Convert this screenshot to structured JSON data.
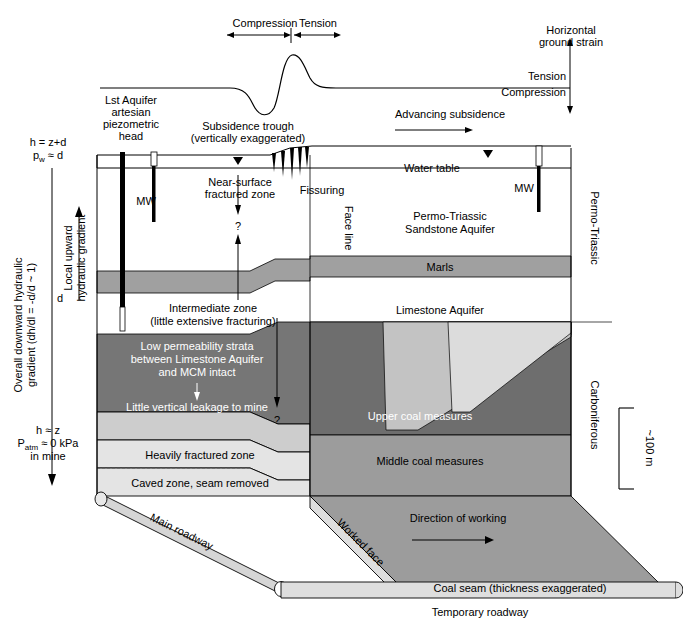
{
  "figure": {
    "type": "geological-cross-section",
    "caption_partial": "Figure 13.3  Hydrogeological conditions in the Permo-Triassic/Carboniferous..."
  },
  "strain_curve": {
    "compression_label": "Compression",
    "tension_label": "Tension",
    "axis_title_line1": "Horizontal",
    "axis_title_line2": "ground strain",
    "axis_tension": "Tension",
    "axis_compression": "Compression",
    "advancing_subsidence": "Advancing subsidence"
  },
  "surface": {
    "lst_aquifer_l1": "Lst Aquifer",
    "lst_aquifer_l2": "artesian",
    "lst_aquifer_l3": "piezometric",
    "lst_aquifer_l4": "head",
    "subsidence_trough_l1": "Subsidence trough",
    "subsidence_trough_l2": "(vertically  exaggerated)",
    "water_table": "Water table",
    "mw_left": "MW",
    "mw_right": "MW",
    "fissuring": "Fissuring",
    "face_line": "Face line",
    "near_surface_l1": "Near-surface",
    "near_surface_l2": "fractured zone",
    "question_mark_1": "?",
    "question_mark_2": "?"
  },
  "hydraulics": {
    "head_top_l1": "h = z+d",
    "head_top_l2": "p",
    "head_top_l2_sub": "w",
    "head_top_l2_rest": " ≈ d",
    "overall_l1": "Overall downward hydraulic",
    "overall_l2": "gradient (dh/dl = -d/d ~ 1)",
    "local_l1": "Local upward",
    "local_l2": "hydraulic gradient",
    "depth_symbol": "d",
    "head_bot_l1": "h ≈ z",
    "head_bot_l2": "P",
    "head_bot_l2_sub": "atm",
    "head_bot_l2_rest": " ≈ 0 kPa",
    "head_bot_l3": "in mine"
  },
  "strata": [
    {
      "name": "permo-triassic-sandstone-aquifer",
      "label_l1": "Permo-Triassic",
      "label_l2": "Sandstone Aquifer",
      "color": "#ffffff"
    },
    {
      "name": "marls",
      "label": "Marls",
      "color": "#a0a0a0"
    },
    {
      "name": "limestone-aquifer",
      "label": "Limestone Aquifer",
      "color": "#ffffff"
    },
    {
      "name": "upper-coal-measures",
      "label": "Upper coal measures",
      "color": "#6e6e6e"
    },
    {
      "name": "middle-coal-measures",
      "label": "Middle coal measures",
      "color": "#9a9a9a"
    },
    {
      "name": "coal-seam",
      "label": "Coal seam (thickness exaggerated)",
      "color": "#9a9a9a"
    }
  ],
  "subsided_zones": {
    "intermediate_l1": "Intermediate zone",
    "intermediate_l2": "(little extensive fracturing)",
    "low_perm_l1": "Low permeability strata",
    "low_perm_l2": "between Limestone Aquifer",
    "low_perm_l3": "and MCM intact",
    "low_perm_l4": "Little vertical leakage to mine",
    "heavily_fractured": "Heavily fractured zone",
    "caved_zone": "Caved zone, seam removed"
  },
  "mine": {
    "main_roadway": "Main roadway",
    "temporary_roadway": "Temporary roadway",
    "worked_face": "Worked face",
    "direction_of_working": "Direction of working"
  },
  "right_axis": {
    "permo_triassic": "Permo-Triassic",
    "carboniferous": "Carboniferous",
    "scale_label": "~100 m"
  },
  "colors": {
    "marls": "#a0a0a0",
    "low_perm_dark": "#767676",
    "upper_coal": "#6e6e6e",
    "middle_coal": "#9c9c9c",
    "light_grey": "#c9c9c9",
    "lighter_grey": "#dcdcdc",
    "pale": "#e6e6e6",
    "roadway": "#d5d5d5",
    "outline": "#000000"
  }
}
